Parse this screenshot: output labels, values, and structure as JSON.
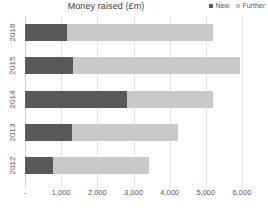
{
  "chart_data": {
    "type": "bar",
    "orientation": "horizontal",
    "stacked": true,
    "title": "Money raised (£m)",
    "xlabel": "",
    "ylabel": "",
    "categories": [
      "2016",
      "2015",
      "2014",
      "2013",
      "2012"
    ],
    "series": [
      {
        "name": "New",
        "color": "#595959",
        "values": [
          1170,
          1340,
          2830,
          1290,
          770
        ]
      },
      {
        "name": "Further",
        "color": "#c9c9c9",
        "values": [
          4030,
          4610,
          2370,
          2930,
          2660
        ]
      }
    ],
    "totals": [
      5200,
      5950,
      5200,
      4220,
      3430
    ],
    "xticks": [
      "-",
      "1,000",
      "2,000",
      "3,000",
      "4,000",
      "5,000",
      "6,000"
    ],
    "xtick_values": [
      0,
      1000,
      2000,
      3000,
      4000,
      5000,
      6000
    ],
    "xlim": [
      0,
      6000
    ],
    "grid": true,
    "legend_position": "top-right"
  },
  "legend": {
    "items": [
      {
        "label": "New",
        "color": "#595959"
      },
      {
        "label": "Further",
        "color": "#c9c9c9"
      }
    ]
  },
  "colors": {
    "new": "#595959",
    "further": "#c9c9c9",
    "grid": "#e4e4e4",
    "text": "#595959",
    "background": "#ffffff"
  }
}
